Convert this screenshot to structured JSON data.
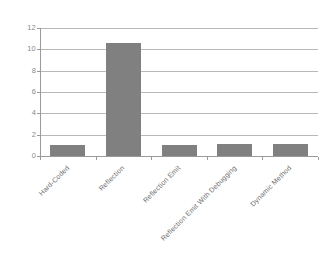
{
  "chart_data": {
    "type": "bar",
    "title": "",
    "subtitle": "",
    "xlabel": "",
    "ylabel": "",
    "categories": [
      "Hard-Coded",
      "Reflection",
      "Reflection Emit",
      "Reflection Emit With Debugging",
      "Dynamic Method"
    ],
    "values": [
      1.0,
      10.6,
      1.0,
      1.1,
      1.15
    ],
    "ylim": [
      0,
      12
    ],
    "ytick_labels": [
      "0",
      "2",
      "4",
      "6",
      "8",
      "10",
      "12"
    ],
    "ytick_values": [
      0,
      2,
      4,
      6,
      8,
      10,
      12
    ],
    "grid": "horizontal",
    "legend": "none",
    "series": [
      {
        "name": "",
        "values": [
          1.0,
          10.6,
          1.0,
          1.1,
          1.15
        ],
        "color": "#808080"
      }
    ]
  },
  "style": {
    "bar_color": "#808080",
    "gridline_color": "#b8b8b8",
    "axis_color": "#9a9a9a",
    "tick_label_color": "#8a8a8a",
    "category_label_color": "#6e6e6e",
    "background": "#ffffff"
  }
}
